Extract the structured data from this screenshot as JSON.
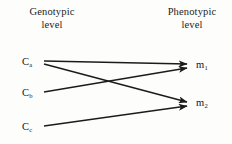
{
  "figure": {
    "background_color": "#fdfdfc",
    "ink_color": "#1b1b1b",
    "width": 232,
    "height": 144
  },
  "headers": {
    "left": {
      "line1": "Genotypic",
      "line2": "level"
    },
    "right": {
      "line1": "Phenotypic",
      "line2": "level"
    }
  },
  "genotype_nodes": [
    {
      "id": "ca",
      "base": "C",
      "subscript": "a",
      "x": 42,
      "y": 62
    },
    {
      "id": "cb",
      "base": "C",
      "subscript": "b",
      "x": 42,
      "y": 93
    },
    {
      "id": "cc",
      "base": "C",
      "subscript": "c",
      "x": 42,
      "y": 127
    }
  ],
  "phenotype_nodes": [
    {
      "id": "m1",
      "base": "m",
      "subscript": "1",
      "x": 193,
      "y": 65
    },
    {
      "id": "m2",
      "base": "m",
      "subscript": "2",
      "x": 193,
      "y": 103
    }
  ],
  "edges": [
    {
      "id": "ca-m1",
      "from": "ca",
      "to": "m1",
      "x1": 44,
      "y1": 61,
      "x2": 187,
      "y2": 64
    },
    {
      "id": "ca-m2",
      "from": "ca",
      "to": "m2",
      "x1": 44,
      "y1": 64,
      "x2": 187,
      "y2": 102
    },
    {
      "id": "cb-m1",
      "from": "cb",
      "to": "m1",
      "x1": 44,
      "y1": 92,
      "x2": 187,
      "y2": 68
    },
    {
      "id": "cc-m2",
      "from": "cc",
      "to": "m2",
      "x1": 44,
      "y1": 126,
      "x2": 187,
      "y2": 106
    }
  ]
}
